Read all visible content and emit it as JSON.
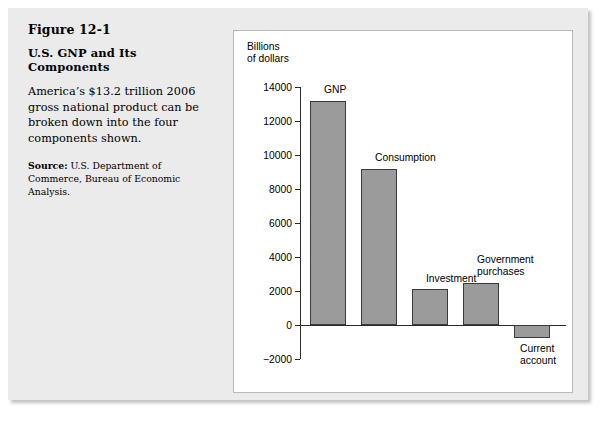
{
  "figure": {
    "number": "Figure 12-1",
    "title": "U.S. GNP and Its Components",
    "description": "America’s $13.2 trillion 2006 gross national product can be broken down into the four components shown.",
    "source_label": "Source:",
    "source_text": " U.S. Department of Commerce, Bureau of Economic Analysis."
  },
  "chart_data": {
    "type": "bar",
    "title": "U.S. GNP and Its Components",
    "categories": [
      "GNP",
      "Consumption",
      "Investment",
      "Government purchases",
      "Current account"
    ],
    "values": [
      13200,
      9200,
      2100,
      2500,
      -750
    ],
    "xlabel": "",
    "ylabel": "Billions\nof dollars",
    "ylim": [
      -2000,
      14000
    ],
    "ytick_labels": [
      "14000",
      "12000",
      "10000",
      "8000",
      "6000",
      "4000",
      "2000",
      "0",
      "−2000"
    ],
    "ytick_values": [
      14000,
      12000,
      10000,
      8000,
      6000,
      4000,
      2000,
      0,
      -2000
    ],
    "grid": false,
    "legend": "none",
    "bar_color": "#9b9b9b",
    "bar_border_color": "#3a3a3a",
    "axis_color": "#2b2b2b"
  }
}
